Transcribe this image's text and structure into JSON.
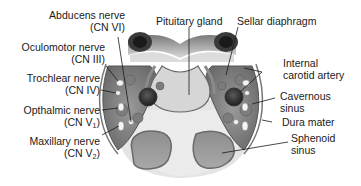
{
  "diagram": {
    "labels_left": [
      {
        "id": "abducens",
        "line1": "Abducens nerve",
        "line2": "(CN VI)"
      },
      {
        "id": "oculomotor",
        "line1": "Oculomotor nerve",
        "line2": "(CN III)"
      },
      {
        "id": "trochlear",
        "line1": "Trochlear nerve",
        "line2": "(CN IV)"
      },
      {
        "id": "ophthalmic",
        "line1": "Opthalmic nerve",
        "line2_prefix": "(CN V",
        "line2_sub": "1",
        "line2_suffix": ")"
      },
      {
        "id": "maxillary",
        "line1": "Maxillary nerve",
        "line2_prefix": "(CN V",
        "line2_sub": "2",
        "line2_suffix": ")"
      }
    ],
    "labels_top": [
      {
        "id": "pituitary",
        "line1": "Pituitary gland"
      },
      {
        "id": "sellar",
        "line1": "Sellar diaphragm"
      }
    ],
    "labels_right": [
      {
        "id": "carotid",
        "line1": "Internal",
        "line2": "carotid artery"
      },
      {
        "id": "cavernous",
        "line1": "Cavernous",
        "line2": "sinus"
      },
      {
        "id": "dura",
        "line1": "Dura mater"
      },
      {
        "id": "sphenoid",
        "line1": "Sphenoid",
        "line2": "sinus"
      }
    ],
    "colors": {
      "tissue_dark": "#4a4a4a",
      "tissue_mid": "#8a8a8a",
      "tissue_light": "#c8c8c8",
      "bone": "#e6e6e6",
      "pituitary": "#d4d4d4",
      "sinus_air": "#9a9a9a",
      "nerve": "#f2f2f2",
      "line": "#1a1a1a"
    }
  }
}
